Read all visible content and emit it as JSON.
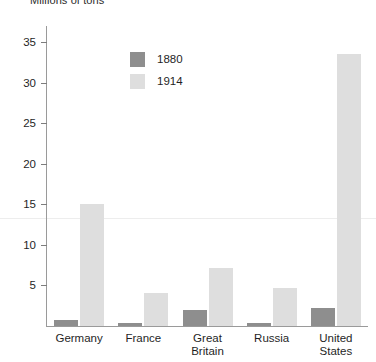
{
  "chart_data": {
    "type": "bar",
    "title": "Millions of tons",
    "xlabel": "",
    "ylabel": "",
    "ylim": [
      0,
      37
    ],
    "grid": false,
    "legend_position": "upper-left-inside",
    "categories": [
      "Germany",
      "France",
      "Great Britain",
      "Russia",
      "United States"
    ],
    "category_lines": [
      [
        "Germany"
      ],
      [
        "France"
      ],
      [
        "Great",
        "Britain"
      ],
      [
        "Russia"
      ],
      [
        "United",
        "States"
      ]
    ],
    "yticks": [
      5,
      10,
      15,
      20,
      25,
      30,
      35
    ],
    "ytick_labels": [
      "5",
      "10",
      "15",
      "20",
      "25",
      "30",
      "35"
    ],
    "series": [
      {
        "name": "1880",
        "color": "#8e8e8e",
        "values": [
          0.7,
          0.4,
          2.0,
          0.4,
          2.2
        ]
      },
      {
        "name": "1914",
        "color": "#dedede",
        "values": [
          15.1,
          4.1,
          7.1,
          4.7,
          33.5
        ]
      }
    ]
  },
  "legend": {
    "items": [
      {
        "label": "1880",
        "color": "#8e8e8e"
      },
      {
        "label": "1914",
        "color": "#dedede"
      }
    ]
  },
  "colors": {
    "series_1880": "#8e8e8e",
    "series_1914": "#dedede",
    "axis": "#9a9a9a",
    "text": "#1f1f1f",
    "background": "#ffffff"
  }
}
